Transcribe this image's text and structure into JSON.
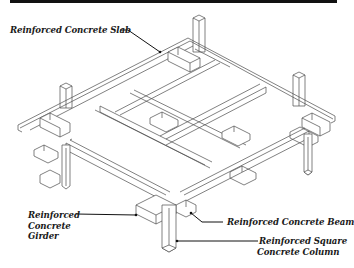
{
  "diagram": {
    "labels": {
      "slab": "Reinforced Concrete Slab",
      "girder": [
        "Reinforced",
        "Concrete",
        "Girder"
      ],
      "beam": "Reinforced Concrete Beam",
      "column": [
        "Reinforced Square",
        "Concrete Column"
      ]
    },
    "colors": {
      "line": "#4a4a4a",
      "leader": "#111111",
      "text": "#1a1a1a",
      "background": "#ffffff"
    }
  }
}
